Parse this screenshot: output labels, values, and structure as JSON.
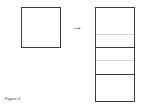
{
  "figure": {
    "caption": "Figure 6",
    "arrow_glyph": "→",
    "colors": {
      "stroke": "#3a3a3a",
      "faint_divider": "#d6d6d6",
      "background": "#ffffff"
    },
    "source_square": {
      "x": 21,
      "y": 7,
      "width": 40,
      "height": 41
    },
    "target_rectangle": {
      "x": 95,
      "y": 7,
      "width": 40,
      "height": 95,
      "dividers": [
        {
          "y": 34,
          "style": "faint"
        },
        {
          "y": 47,
          "style": "solid"
        },
        {
          "y": 60,
          "style": "faint"
        },
        {
          "y": 74,
          "style": "solid"
        }
      ]
    }
  }
}
